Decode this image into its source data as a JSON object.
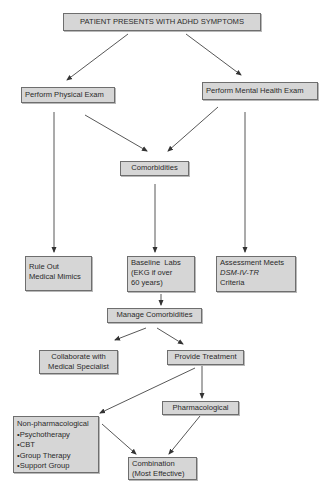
{
  "diagram": {
    "nodes": {
      "start": "PATIENT PRESENTS WITH ADHD SYMPTOMS",
      "physical_exam": "Perform Physical Exam",
      "mental_exam": "Perform Mental Health Exam",
      "comorbidities": "Comorbidities",
      "rule_out": [
        "Rule Out",
        "Medical Mimics"
      ],
      "baseline_labs": [
        "Baseline  Labs",
        "(EKG if over",
        "60 years)"
      ],
      "assessment": [
        "Assessment Meets",
        "DSM-IV-TR",
        "Criteria"
      ],
      "manage_comorbidities": "Manage Comorbidities",
      "collaborate": [
        "Collaborate with",
        "Medical Specialist"
      ],
      "provide_treatment": "Provide Treatment",
      "pharmacological": "Pharmacological",
      "non_pharmacological": {
        "title": "Non-pharmacological",
        "items": [
          "Psychotherapy",
          "CBT",
          "Group Therapy",
          "Support Group"
        ]
      },
      "combination": [
        "Combination",
        "(Most Effective)"
      ]
    },
    "edges": [
      [
        "start",
        "physical_exam"
      ],
      [
        "start",
        "mental_exam"
      ],
      [
        "physical_exam",
        "comorbidities"
      ],
      [
        "mental_exam",
        "comorbidities"
      ],
      [
        "physical_exam",
        "rule_out"
      ],
      [
        "comorbidities",
        "baseline_labs"
      ],
      [
        "mental_exam",
        "assessment"
      ],
      [
        "baseline_labs",
        "manage_comorbidities"
      ],
      [
        "manage_comorbidities",
        "collaborate"
      ],
      [
        "manage_comorbidities",
        "provide_treatment"
      ],
      [
        "provide_treatment",
        "non_pharmacological"
      ],
      [
        "provide_treatment",
        "pharmacological"
      ],
      [
        "non_pharmacological",
        "combination"
      ],
      [
        "pharmacological",
        "combination"
      ]
    ],
    "colors": {
      "box_fill": "#d6d6d6",
      "box_border": "#6e6e6e",
      "line": "#333333"
    }
  }
}
